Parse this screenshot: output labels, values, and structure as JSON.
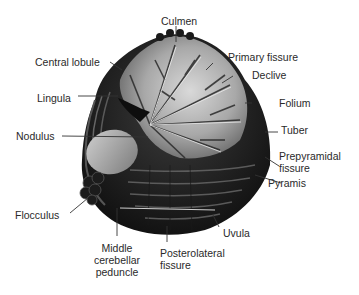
{
  "figure": {
    "colors": {
      "background": "#ffffff",
      "tissue_dark": "#111111",
      "tissue_mid": "#3a3a3a",
      "white_matter": "#bdbdbd",
      "label_text": "#2a2a2a",
      "leader_line": "#333333"
    }
  },
  "labels": {
    "culmen": "Culmen",
    "central_lobule": "Central lobule",
    "primary_fissure": "Primary fissure",
    "declive": "Declive",
    "lingula": "Lingula",
    "folium": "Folium",
    "nodulus": "Nodulus",
    "tuber": "Tuber",
    "prepyramidal_fissure_line1": "Prepyramidal",
    "prepyramidal_fissure_line2": "fissure",
    "pyramis": "Pyramis",
    "flocculus": "Flocculus",
    "uvula": "Uvula",
    "middle_cerebellar_peduncle_line1": "Middle",
    "middle_cerebellar_peduncle_line2": "cerebellar",
    "middle_cerebellar_peduncle_line3": "peduncle",
    "posterolateral_fissure_line1": "Posterolateral",
    "posterolateral_fissure_line2": "fissure"
  }
}
